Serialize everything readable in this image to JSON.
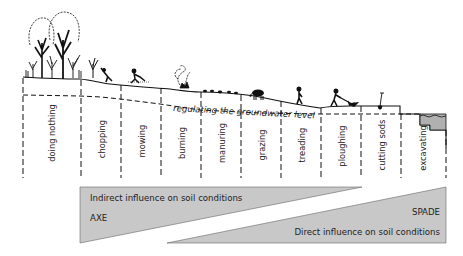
{
  "diagram": {
    "groundwater_label": "regulating the groundwater level",
    "activities": [
      {
        "label": "doing nothing",
        "x": 50
      },
      {
        "label": "chopping",
        "x": 101
      },
      {
        "label": "mowing",
        "x": 141
      },
      {
        "label": "burning",
        "x": 181
      },
      {
        "label": "manuring",
        "x": 221
      },
      {
        "label": "grazing",
        "x": 261
      },
      {
        "label": "treading",
        "x": 301
      },
      {
        "label": "ploughing",
        "x": 341
      },
      {
        "label": "cutting sods",
        "x": 381
      },
      {
        "label": "excavating",
        "x": 423
      }
    ],
    "wedges": {
      "indirect": {
        "label": "Indirect influence on soil conditions",
        "tool": "AXE"
      },
      "direct": {
        "label": "Direct influence on soil conditions",
        "tool": "SPADE"
      }
    },
    "colors": {
      "wedge_fill": "#c8c8c8",
      "line": "#111111",
      "water_fill": "#b0b0b0"
    }
  }
}
